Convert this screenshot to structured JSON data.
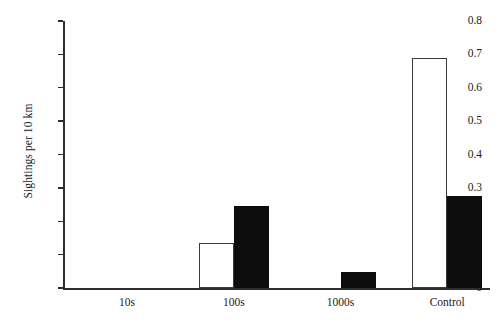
{
  "chart_data": {
    "type": "bar",
    "title": "",
    "xlabel": "",
    "ylabel": "Sightings per 10 km",
    "categories": [
      "10s",
      "100s",
      "1000s",
      "Control"
    ],
    "series": [
      {
        "name": "open",
        "style": "white-filled-black-outline",
        "values": [
          0,
          0.135,
          0,
          0.688
        ]
      },
      {
        "name": "filled",
        "style": "solid-black",
        "values": [
          0,
          0.245,
          0.048,
          0.275
        ]
      }
    ],
    "ylim": [
      0,
      0.8
    ],
    "ytick_values": [
      0,
      0.1,
      0.2,
      0.3,
      0.4,
      0.5,
      0.6,
      0.7,
      0.8
    ],
    "ytick_labels": [
      "0",
      "0.1",
      "0.2",
      "0.3",
      "0.4",
      "0.5",
      "0.6",
      "0.7",
      "0.8"
    ],
    "grid": false,
    "legend": "none",
    "colors": {
      "open_fill": "#ffffff",
      "open_border": "#3a3a3a",
      "filled_fill": "#0d0d0d",
      "axis": "#2e2e2e",
      "background": "#ffffff",
      "text": "#1a1a1a"
    }
  }
}
